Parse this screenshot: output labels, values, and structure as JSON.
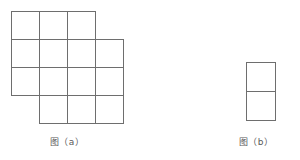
{
  "page": {
    "background_color": "#ffffff",
    "stroke_color": "#6e6e6e",
    "caption_color": "#595959"
  },
  "figures": [
    {
      "id": "figure-a",
      "caption": "图（a）",
      "shape_name": "staircase-polyomino",
      "grid": {
        "rows": 4,
        "cols": 4,
        "cell_size_px": 28,
        "origin_x_px": 11,
        "origin_y_px": 11,
        "filled_cell_count": 14,
        "filled_cells": [
          [
            1,
            1
          ],
          [
            1,
            2
          ],
          [
            1,
            3
          ],
          [
            2,
            1
          ],
          [
            2,
            2
          ],
          [
            2,
            3
          ],
          [
            2,
            4
          ],
          [
            3,
            1
          ],
          [
            3,
            2
          ],
          [
            3,
            3
          ],
          [
            3,
            4
          ],
          [
            4,
            2
          ],
          [
            4,
            3
          ],
          [
            4,
            4
          ]
        ],
        "empty_cells": [
          [
            1,
            4
          ],
          [
            4,
            1
          ]
        ]
      }
    },
    {
      "id": "figure-b",
      "caption": "图（b）",
      "shape_name": "vertical-domino",
      "grid": {
        "rows": 2,
        "cols": 1,
        "cell_size_px": 29,
        "origin_x_px": 8,
        "origin_y_px": 8,
        "filled_cell_count": 2,
        "filled_cells": [
          [
            1,
            1
          ],
          [
            2,
            1
          ]
        ],
        "empty_cells": []
      }
    }
  ]
}
